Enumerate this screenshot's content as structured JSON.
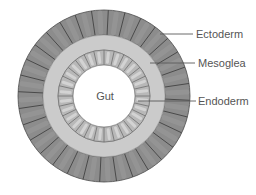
{
  "diagram": {
    "center": {
      "x": 104,
      "y": 96
    },
    "layers": [
      {
        "id": "ectoderm",
        "label": "Ectoderm",
        "outer_r": 86,
        "inner_r": 61,
        "segments": 32,
        "fill": "#8c8c8c",
        "stroke": "#4a4a4a"
      },
      {
        "id": "mesoglea",
        "label": "Mesoglea",
        "outer_r": 61,
        "inner_r": 46,
        "fill": "#cbcbcb",
        "stroke": "#9a9a9a"
      },
      {
        "id": "endoderm",
        "label": "Endoderm",
        "outer_r": 46,
        "inner_r": 31,
        "segments": 28,
        "fill": "#b8b8b8",
        "highlight": "#dadada",
        "stroke": "#6e6e6e"
      }
    ],
    "gut": {
      "label": "Gut",
      "r": 31,
      "fill": "#ffffff"
    },
    "labels": [
      {
        "text": "Ectoderm",
        "line": {
          "x1": 160,
          "y1": 34,
          "x2": 193,
          "y2": 34
        },
        "text_x": 196,
        "text_y": 28
      },
      {
        "text": "Mesoglea",
        "line": {
          "x1": 150,
          "y1": 63,
          "x2": 195,
          "y2": 63
        },
        "text_x": 198,
        "text_y": 57
      },
      {
        "text": "Endoderm",
        "line": {
          "x1": 138,
          "y1": 101,
          "x2": 196,
          "y2": 101
        },
        "text_x": 198,
        "text_y": 95
      }
    ],
    "line_color": "#5a5a5a"
  }
}
